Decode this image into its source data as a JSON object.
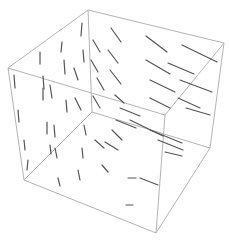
{
  "chart_data": {
    "type": "vector-field-3d",
    "title": "",
    "xlabel": "",
    "ylabel": "",
    "zlabel": "",
    "grid": false,
    "legend": null,
    "box": true,
    "colors": {
      "box": "#b4b4b4",
      "vectors": "#555555",
      "background": "#ffffff"
    },
    "box_vertices": {
      "top_back": [
        88,
        10
      ],
      "top_left": [
        8,
        68
      ],
      "top_right": [
        224,
        43
      ],
      "top_front": [
        165,
        115
      ],
      "bottom_back": [
        92,
        112
      ],
      "bottom_left": [
        24,
        180
      ],
      "bottom_right": [
        210,
        148
      ],
      "bottom_front": [
        156,
        233
      ]
    },
    "box_edges": [
      [
        "top_back",
        "top_left"
      ],
      [
        "top_back",
        "top_right"
      ],
      [
        "top_left",
        "top_front"
      ],
      [
        "top_right",
        "top_front"
      ],
      [
        "top_left",
        "bottom_left"
      ],
      [
        "top_right",
        "bottom_right"
      ],
      [
        "top_front",
        "bottom_front"
      ],
      [
        "top_back",
        "bottom_back"
      ],
      [
        "bottom_back",
        "bottom_left"
      ],
      [
        "bottom_back",
        "bottom_right"
      ],
      [
        "bottom_left",
        "bottom_front"
      ],
      [
        "bottom_right",
        "bottom_front"
      ]
    ],
    "vectors": [
      [
        82,
        23,
        81,
        36
      ],
      [
        62,
        42,
        61,
        52
      ],
      [
        40,
        52,
        40,
        64
      ],
      [
        43,
        76,
        44,
        89
      ],
      [
        64,
        60,
        65,
        74
      ],
      [
        74,
        68,
        78,
        80
      ],
      [
        83,
        50,
        84,
        62
      ],
      [
        14,
        75,
        15,
        88
      ],
      [
        43,
        88,
        43,
        100
      ],
      [
        50,
        85,
        52,
        98
      ],
      [
        66,
        100,
        67,
        112
      ],
      [
        75,
        98,
        81,
        110
      ],
      [
        18,
        110,
        19,
        122
      ],
      [
        24,
        140,
        25,
        150
      ],
      [
        28,
        160,
        27,
        170
      ],
      [
        47,
        122,
        47,
        134
      ],
      [
        54,
        125,
        55,
        137
      ],
      [
        50,
        145,
        51,
        154
      ],
      [
        55,
        148,
        57,
        158
      ],
      [
        84,
        125,
        86,
        135
      ],
      [
        82,
        148,
        83,
        158
      ],
      [
        78,
        170,
        80,
        180
      ],
      [
        58,
        178,
        60,
        186
      ],
      [
        93,
        40,
        100,
        52
      ],
      [
        91,
        60,
        98,
        72
      ],
      [
        97,
        78,
        104,
        90
      ],
      [
        93,
        96,
        100,
        108
      ],
      [
        111,
        28,
        121,
        42
      ],
      [
        108,
        50,
        118,
        63
      ],
      [
        110,
        70,
        121,
        84
      ],
      [
        115,
        95,
        124,
        103
      ],
      [
        146,
        36,
        167,
        52
      ],
      [
        146,
        60,
        170,
        74
      ],
      [
        150,
        80,
        175,
        92
      ],
      [
        150,
        98,
        170,
        108
      ],
      [
        182,
        45,
        217,
        62
      ],
      [
        168,
        63,
        194,
        74
      ],
      [
        180,
        80,
        212,
        92
      ],
      [
        178,
        98,
        200,
        108
      ],
      [
        186,
        108,
        210,
        115
      ],
      [
        120,
        108,
        140,
        116
      ],
      [
        112,
        130,
        122,
        140
      ],
      [
        95,
        140,
        104,
        148
      ],
      [
        105,
        142,
        118,
        150
      ],
      [
        150,
        130,
        182,
        143
      ],
      [
        158,
        140,
        183,
        150
      ],
      [
        165,
        152,
        182,
        156
      ],
      [
        102,
        165,
        108,
        172
      ],
      [
        128,
        178,
        136,
        178
      ],
      [
        140,
        178,
        158,
        185
      ],
      [
        126,
        205,
        133,
        205
      ],
      [
        116,
        120,
        136,
        128
      ],
      [
        130,
        120,
        163,
        136
      ]
    ]
  }
}
